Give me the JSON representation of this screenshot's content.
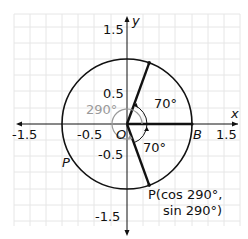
{
  "diagram": {
    "axes": {
      "x_label": "x",
      "y_label": "y",
      "x_ticks": [
        "-1.5",
        "-0.5",
        "1.5"
      ],
      "y_ticks": [
        "1.5",
        "0.5",
        "-0.5",
        "-1.5"
      ]
    },
    "points": {
      "origin": "O",
      "b": "B",
      "p_left": "P",
      "p_coord_line1": "P(cos 290°,",
      "p_coord_line2": "sin 290°)"
    },
    "angles": {
      "big": "290°",
      "upper": "70°",
      "lower": "70°"
    },
    "colors": {
      "grid": "#e6e6e6",
      "ink": "#111111",
      "gray_arc": "#9a9a9a"
    }
  }
}
